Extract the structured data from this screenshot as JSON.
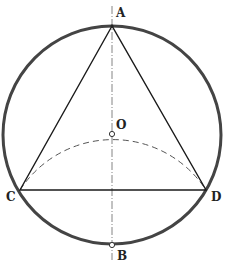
{
  "diagram": {
    "type": "geometry-construction",
    "circle": {
      "cx": 112,
      "cy": 135,
      "r": 109
    },
    "points": {
      "A": {
        "label": "A",
        "x": 112,
        "y": 26
      },
      "O": {
        "label": "O",
        "x": 112,
        "y": 134
      },
      "B": {
        "label": "B",
        "x": 112,
        "y": 245
      },
      "C": {
        "label": "C",
        "x": 20,
        "y": 190
      },
      "D": {
        "label": "D",
        "x": 206,
        "y": 190
      }
    },
    "colors": {
      "circle": "#444444",
      "line": "#1a1a1a",
      "dashed": "#555555"
    }
  }
}
